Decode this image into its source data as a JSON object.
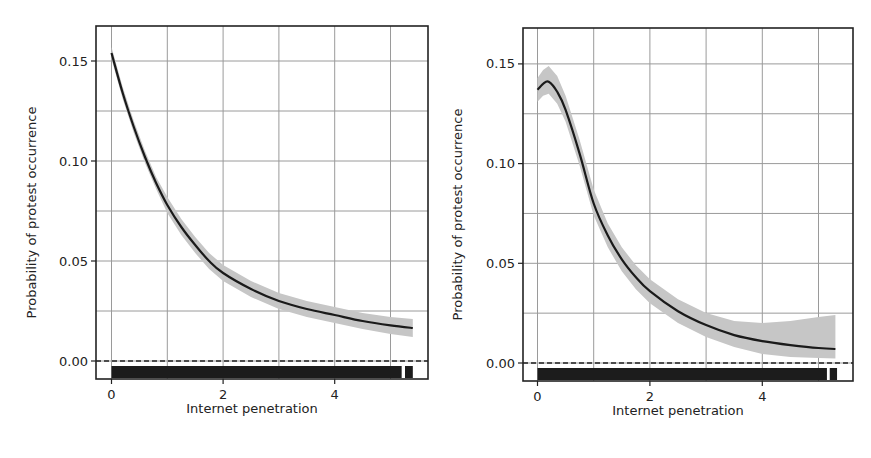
{
  "chart_data": [
    {
      "type": "line",
      "panel": "left",
      "title": "",
      "xlabel": "Internet penetration",
      "ylabel": "Probability of protest occurrence",
      "xlim": [
        -0.2,
        5.6
      ],
      "ylim": [
        -0.009,
        0.167
      ],
      "xticks": [
        0,
        2,
        4
      ],
      "xtick_labels": [
        "0",
        "2",
        "4"
      ],
      "yticks": [
        0.0,
        0.05,
        0.1,
        0.15
      ],
      "ytick_labels": [
        "0.00",
        "0.05",
        "0.10",
        "0.15"
      ],
      "grid": true,
      "minor_grid_x": [
        1,
        3,
        5
      ],
      "minor_grid_y": [
        0.025,
        0.075,
        0.125
      ],
      "reference_line": {
        "y": 0.0,
        "style": "dashed"
      },
      "series": [
        {
          "name": "Predicted probability",
          "x": [
            0,
            0.2,
            0.4,
            0.6,
            0.8,
            1.0,
            1.25,
            1.5,
            1.75,
            2.0,
            2.5,
            3.0,
            3.5,
            4.0,
            4.5,
            5.0,
            5.4
          ],
          "y": [
            0.154,
            0.134,
            0.117,
            0.102,
            0.089,
            0.078,
            0.067,
            0.058,
            0.05,
            0.044,
            0.036,
            0.03,
            0.026,
            0.023,
            0.02,
            0.0178,
            0.0165
          ],
          "ci_lower": [
            0.151,
            0.131,
            0.114,
            0.099,
            0.086,
            0.074,
            0.063,
            0.054,
            0.046,
            0.04,
            0.032,
            0.026,
            0.022,
            0.019,
            0.016,
            0.0135,
            0.012
          ],
          "ci_upper": [
            0.157,
            0.137,
            0.12,
            0.105,
            0.092,
            0.082,
            0.071,
            0.062,
            0.054,
            0.048,
            0.04,
            0.034,
            0.03,
            0.027,
            0.024,
            0.022,
            0.021
          ]
        }
      ],
      "rug": {
        "segments": [
          [
            0,
            5.2
          ],
          [
            5.26,
            5.4
          ]
        ]
      }
    },
    {
      "type": "line",
      "panel": "right",
      "title": "",
      "xlabel": "Internet penetration",
      "ylabel": "Probability of protest occurrence",
      "xlim": [
        -0.2,
        5.7
      ],
      "ylim": [
        -0.009,
        0.168
      ],
      "xticks": [
        0,
        2,
        4
      ],
      "xtick_labels": [
        "0",
        "2",
        "4"
      ],
      "yticks": [
        0.0,
        0.05,
        0.1,
        0.15
      ],
      "ytick_labels": [
        "0.00",
        "0.05",
        "0.10",
        "0.15"
      ],
      "grid": true,
      "minor_grid_x": [
        1,
        3,
        5
      ],
      "minor_grid_y": [
        0.025,
        0.075,
        0.125
      ],
      "reference_line": {
        "y": 0.0,
        "style": "dashed"
      },
      "series": [
        {
          "name": "Predicted probability",
          "x": [
            0,
            0.1,
            0.2,
            0.35,
            0.5,
            0.75,
            1.0,
            1.25,
            1.5,
            1.75,
            2.0,
            2.5,
            3.0,
            3.5,
            4.0,
            4.5,
            5.0,
            5.3
          ],
          "y": [
            0.137,
            0.14,
            0.141,
            0.136,
            0.127,
            0.105,
            0.08,
            0.064,
            0.052,
            0.043,
            0.036,
            0.026,
            0.019,
            0.014,
            0.011,
            0.009,
            0.0075,
            0.007
          ],
          "ci_lower": [
            0.131,
            0.134,
            0.135,
            0.13,
            0.121,
            0.099,
            0.074,
            0.058,
            0.046,
            0.037,
            0.03,
            0.02,
            0.013,
            0.008,
            0.0045,
            0.003,
            0.0025,
            0.0022
          ],
          "ci_upper": [
            0.143,
            0.147,
            0.149,
            0.144,
            0.134,
            0.112,
            0.087,
            0.07,
            0.058,
            0.049,
            0.042,
            0.032,
            0.025,
            0.021,
            0.02,
            0.021,
            0.023,
            0.024
          ]
        }
      ],
      "rug": {
        "segments": [
          [
            0,
            5.15
          ],
          [
            5.2,
            5.33
          ]
        ]
      }
    }
  ],
  "style": {
    "line_color": "#1a1a1a",
    "ci_color": "#c6c6c6",
    "grid_color": "#9a9a9a",
    "frame_color": "#222222",
    "rug_color": "#1c1c1c"
  },
  "panels_layout": [
    {
      "frame": [
        96,
        26,
        428,
        379
      ],
      "x0px": 111.5,
      "xstep": 55.8,
      "y0px": 361,
      "ystep": 100,
      "ylabel_x": 31,
      "xlabel_y": 413
    },
    {
      "frame": [
        523,
        28,
        853,
        381
      ],
      "x0px": 537.5,
      "xstep": 56.2,
      "y0px": 363,
      "ystep": 99.7,
      "ylabel_x": 457,
      "xlabel_y": 415
    }
  ]
}
